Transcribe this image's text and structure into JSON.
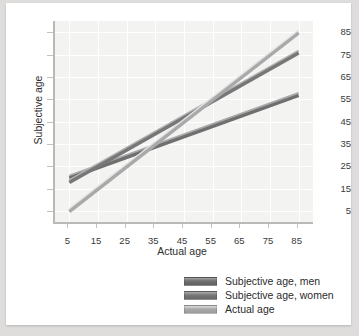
{
  "chart_data": {
    "type": "line",
    "title": "",
    "subtitle": "",
    "xlabel": "Actual age",
    "ylabel": "Subjective age",
    "xlim": [
      0,
      90
    ],
    "ylim": [
      0,
      90
    ],
    "xticks": [
      5,
      15,
      25,
      35,
      45,
      55,
      65,
      75,
      85
    ],
    "yticks": [
      5,
      15,
      25,
      35,
      45,
      55,
      65,
      75,
      85
    ],
    "grid": true,
    "legend_position": "bottom-right",
    "x": [
      5,
      85
    ],
    "series": [
      {
        "name": "Subjective age, men",
        "color": "#6f6f6f",
        "values": [
          20,
          57
        ]
      },
      {
        "name": "Subjective age, women",
        "color": "#777777",
        "values": [
          18,
          76
        ]
      },
      {
        "name": "Actual age",
        "color": "#a9a9a9",
        "values": [
          5,
          85
        ]
      }
    ],
    "annotations": []
  },
  "axes": {
    "y_title": "Subjective age",
    "x_title": "Actual age",
    "y_tick_labels": [
      "85",
      "75",
      "65",
      "55",
      "45",
      "35",
      "25",
      "15",
      "5"
    ],
    "x_tick_labels": [
      "5",
      "15",
      "25",
      "35",
      "45",
      "55",
      "65",
      "75",
      "85"
    ]
  },
  "legend": {
    "items": [
      {
        "label": "Subjective age, men",
        "color": "#6f6f6f"
      },
      {
        "label": "Subjective age, women",
        "color": "#777777"
      },
      {
        "label": "Actual age",
        "color": "#a9a9a9"
      }
    ]
  },
  "colors": {
    "page_background": "#dedddb",
    "card_background": "#ffffff",
    "plot_background": "#f3f3f2",
    "gridline": "#ffffff",
    "axis": "#b9b9b7",
    "text": "#2e2e2e"
  }
}
